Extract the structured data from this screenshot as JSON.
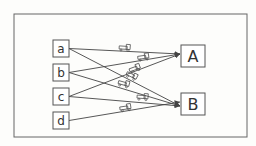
{
  "diagram": {
    "sources": [
      {
        "id": "a",
        "label": "a",
        "x": 53,
        "y": 40
      },
      {
        "id": "b",
        "label": "b",
        "x": 53,
        "y": 64
      },
      {
        "id": "c",
        "label": "c",
        "x": 53,
        "y": 88
      },
      {
        "id": "d",
        "label": "d",
        "x": 53,
        "y": 112
      }
    ],
    "targets": [
      {
        "id": "A",
        "label": "A",
        "x": 181,
        "y": 45
      },
      {
        "id": "B",
        "label": "B",
        "x": 181,
        "y": 93
      }
    ],
    "edges": [
      {
        "from": "a",
        "to": "A"
      },
      {
        "from": "a",
        "to": "B"
      },
      {
        "from": "b",
        "to": "A"
      },
      {
        "from": "b",
        "to": "B"
      },
      {
        "from": "c",
        "to": "A"
      },
      {
        "from": "c",
        "to": "B"
      },
      {
        "from": "d",
        "to": "B"
      }
    ],
    "edge_icon": "truck-icon",
    "colors": {
      "line": "#444444",
      "box": "#555555",
      "background": "#fdfdfb"
    }
  }
}
